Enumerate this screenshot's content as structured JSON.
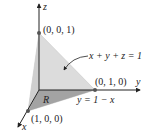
{
  "diagram": {
    "axes": {
      "x_label": "x",
      "y_label": "y",
      "z_label": "z"
    },
    "points": [
      {
        "name": "z-intercept",
        "label": "(0, 0, 1)"
      },
      {
        "name": "y-intercept",
        "label": "(0, 1, 0)"
      },
      {
        "name": "x-intercept",
        "label": "(1, 0, 0)"
      }
    ],
    "plane_label": "x + y + z = 1",
    "region_label": "R",
    "boundary_label": "y = 1 − x",
    "colors": {
      "plane": "#d9d9d9",
      "plane_edge": "#c4c4c4",
      "region": "#9e9e9e",
      "axis": "#222222",
      "point": "#555555"
    }
  }
}
